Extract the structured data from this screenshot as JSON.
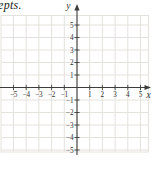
{
  "page": {
    "fragment_text": "epts."
  },
  "chart_data": {
    "type": "scatter",
    "title": "",
    "xlabel": "x",
    "ylabel": "y",
    "xlim": [
      -6,
      6
    ],
    "ylim": [
      -6,
      6
    ],
    "x_ticks": [
      -5,
      -4,
      -3,
      -2,
      -1,
      1,
      2,
      3,
      4,
      5
    ],
    "y_ticks": [
      -5,
      -4,
      -3,
      -2,
      -1,
      1,
      2,
      3,
      4,
      5
    ],
    "grid": true,
    "legend": "none",
    "series": [],
    "colors": {
      "grid": "#e4e2dc",
      "axis": "#3d3d3d",
      "tick_label": "#333333",
      "axis_label": "#222222",
      "background": "#ffffff"
    }
  }
}
